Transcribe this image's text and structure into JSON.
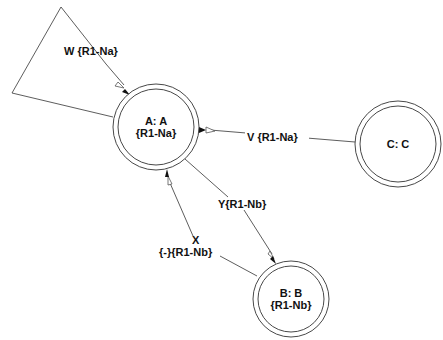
{
  "diagram": {
    "type": "state-machine",
    "nodes": [
      {
        "id": "A",
        "line1": "A: A",
        "line2": "{R1-Na}"
      },
      {
        "id": "B",
        "line1": "B: B",
        "line2": "{R1-Nb}"
      },
      {
        "id": "C",
        "line1": "C: C",
        "line2": ""
      }
    ],
    "edges": [
      {
        "id": "W",
        "from": "A",
        "to": "A",
        "line1": "W {R1-Na}",
        "line2": ""
      },
      {
        "id": "V",
        "from": "C",
        "to": "A",
        "line1": "V {R1-Na}",
        "line2": ""
      },
      {
        "id": "Y",
        "from": "A",
        "to": "B",
        "line1": "Y{R1-Nb}",
        "line2": ""
      },
      {
        "id": "X",
        "from": "B",
        "to": "A",
        "line1": "X",
        "line2": "{-}{R1-Nb}"
      }
    ]
  }
}
